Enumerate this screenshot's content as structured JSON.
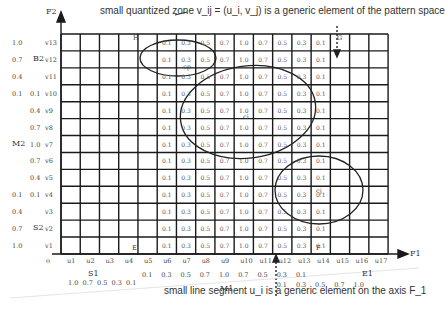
{
  "top_caption": "small quantized zone v_ij = (u_i, v_j) is a generic element of the pattern space",
  "bottom_caption": "small line segment u_i is a generic element on the axis F_1",
  "axes": {
    "y_axis_label": "F2",
    "x_axis_label": "F1",
    "origin_label": "o"
  },
  "grid": {
    "columns": 17,
    "rows": 13,
    "x_ticks": [
      "u1",
      "u2",
      "u3",
      "u4",
      "u5",
      "u6",
      "u7",
      "u8",
      "u9",
      "u10",
      "u11",
      "u12",
      "u13",
      "u14",
      "u15",
      "u16",
      "u17"
    ],
    "y_ticks_top_to_bottom": [
      "v13",
      "v12",
      "v11",
      "v10",
      "v9",
      "v8",
      "v7",
      "v6",
      "v5",
      "v4",
      "v3",
      "v2",
      "v1"
    ],
    "filled_columns": [
      "u5",
      "u6",
      "u7",
      "u8",
      "u9",
      "u10",
      "u11",
      "u12",
      "u13",
      "u14"
    ],
    "cell_values_per_row": [
      "0.1",
      "0.3",
      "0.5",
      "0.7",
      "1.0",
      "0.7",
      "0.5",
      "0.3",
      "0.1"
    ],
    "corner_labels": {
      "H": "H",
      "G": "G",
      "E": "E",
      "F": "F"
    }
  },
  "y_membership": {
    "B2": {
      "label": "B2",
      "values_top_to_bottom": [
        "1.0",
        "0.7",
        "0.4",
        "0.1"
      ]
    },
    "M2": {
      "label": "M2",
      "values_top_to_bottom": [
        "0.1",
        "0.4",
        "0.7",
        "1.0",
        "0.7",
        "0.4",
        "0.1"
      ]
    },
    "S2": {
      "label": "S2",
      "values_top_to_bottom": [
        "0.1",
        "0.4",
        "0.7",
        "1.0"
      ]
    }
  },
  "x_membership": {
    "S1": {
      "label": "S1",
      "values": [
        "1.0",
        "0.7",
        "0.5",
        "0.3",
        "0.1"
      ]
    },
    "M1": {
      "label": "M1",
      "values": [
        "0.1",
        "0.3",
        "0.5",
        "0.7",
        "1.0",
        "0.7",
        "0.5",
        "0.3",
        "0.1"
      ]
    },
    "E1": {
      "label": "E1",
      "values": [
        "0.1",
        "0.3",
        "0.5",
        "0.7",
        "1.0"
      ]
    }
  },
  "clusters": [
    {
      "label": "cp",
      "shape": "ellipse"
    },
    {
      "label": "ci",
      "shape": "ellipse"
    },
    {
      "label": "cj",
      "shape": "ellipse"
    }
  ],
  "colors": {
    "grid": "#1a1a1a",
    "text": "#333333",
    "cell_text": "#555555"
  }
}
